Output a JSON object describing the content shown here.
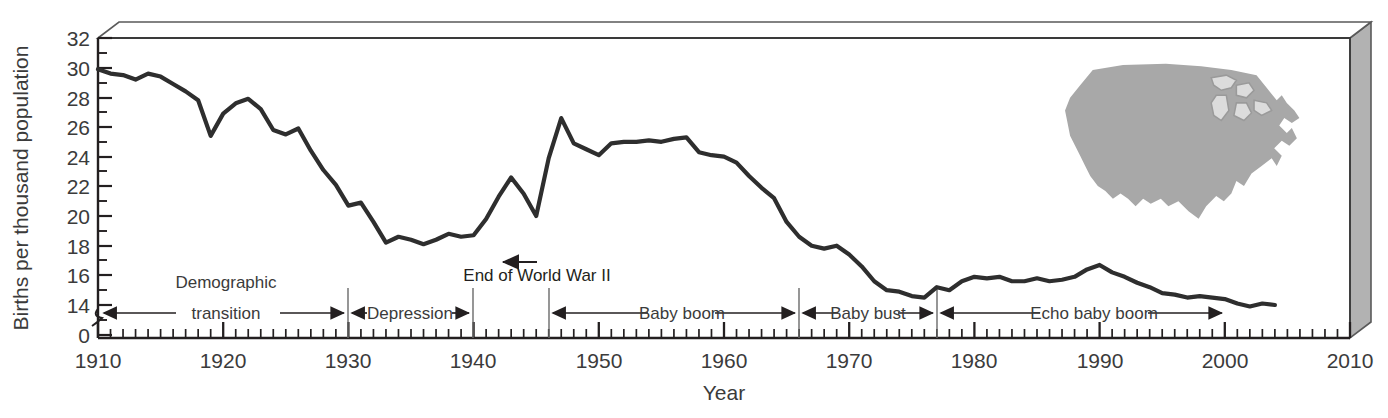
{
  "chart_data": {
    "type": "line",
    "title": "",
    "xlabel": "Year",
    "ylabel": "Births per thousand population",
    "xlim": [
      1910,
      2010
    ],
    "ylim": [
      0,
      32
    ],
    "y_axis_break": true,
    "y_break_label": "0",
    "grid": false,
    "legend": "none",
    "x_tick_labels": [
      "1910",
      "1920",
      "1930",
      "1940",
      "1950",
      "1960",
      "1970",
      "1980",
      "1990",
      "2000",
      "2010"
    ],
    "x_tick_step_minor": 1,
    "y_tick_labels": [
      "0",
      "14",
      "16",
      "18",
      "20",
      "22",
      "24",
      "26",
      "28",
      "30",
      "32"
    ],
    "x": [
      1910,
      1911,
      1912,
      1913,
      1914,
      1915,
      1916,
      1917,
      1918,
      1919,
      1920,
      1921,
      1922,
      1923,
      1924,
      1925,
      1926,
      1927,
      1928,
      1929,
      1930,
      1931,
      1932,
      1933,
      1934,
      1935,
      1936,
      1937,
      1938,
      1939,
      1940,
      1941,
      1942,
      1943,
      1944,
      1945,
      1946,
      1947,
      1948,
      1949,
      1950,
      1951,
      1952,
      1953,
      1954,
      1955,
      1956,
      1957,
      1958,
      1959,
      1960,
      1961,
      1962,
      1963,
      1964,
      1965,
      1966,
      1967,
      1968,
      1969,
      1970,
      1971,
      1972,
      1973,
      1974,
      1975,
      1976,
      1977,
      1978,
      1979,
      1980,
      1981,
      1982,
      1983,
      1984,
      1985,
      1986,
      1987,
      1988,
      1989,
      1990,
      1991,
      1992,
      1993,
      1994,
      1995,
      1996,
      1997,
      1998,
      1999,
      2000,
      2001,
      2002,
      2003,
      2004
    ],
    "values": [
      29.9,
      29.6,
      29.5,
      29.2,
      29.6,
      29.4,
      28.9,
      28.4,
      27.8,
      25.4,
      26.9,
      27.6,
      27.9,
      27.2,
      25.8,
      25.5,
      25.9,
      24.4,
      23.1,
      22.1,
      20.7,
      20.9,
      19.6,
      18.2,
      18.6,
      18.4,
      18.1,
      18.4,
      18.8,
      18.6,
      18.7,
      19.8,
      21.3,
      22.6,
      21.5,
      20.0,
      23.9,
      26.6,
      24.9,
      24.5,
      24.1,
      24.9,
      25.0,
      25.0,
      25.1,
      25.0,
      25.2,
      25.3,
      24.3,
      24.1,
      24.0,
      23.6,
      22.7,
      21.9,
      21.2,
      19.6,
      18.6,
      18.0,
      17.8,
      18.0,
      17.4,
      16.6,
      15.6,
      15.0,
      14.9,
      14.6,
      14.5,
      15.2,
      15.0,
      15.6,
      15.9,
      15.8,
      15.9,
      15.6,
      15.6,
      15.8,
      15.6,
      15.7,
      15.9,
      16.4,
      16.7,
      16.2,
      15.9,
      15.5,
      15.2,
      14.8,
      14.7,
      14.5,
      14.6,
      14.5,
      14.4,
      14.1,
      13.9,
      14.1,
      14.0
    ],
    "series_values_plot": [
      29.9,
      29.6,
      29.5,
      29.2,
      29.6,
      29.4,
      28.9,
      28.4,
      27.8,
      25.4,
      26.9,
      27.6,
      27.9,
      27.2,
      25.8,
      25.5,
      25.9,
      24.4,
      23.1,
      22.1,
      20.7,
      20.9,
      19.6,
      18.2,
      18.6,
      18.4,
      18.1,
      18.4,
      18.8,
      18.6,
      18.7,
      19.8,
      21.3,
      22.6,
      21.5,
      20.0,
      23.9,
      26.6,
      24.9,
      24.5,
      24.1,
      24.9,
      25.0,
      25.0,
      25.1,
      25.0,
      25.2,
      25.3,
      24.3,
      24.1,
      24.0,
      23.6,
      22.7,
      21.9,
      21.2,
      19.6,
      18.6,
      18.0,
      17.8,
      18.0,
      17.4,
      16.6,
      15.6,
      15.0,
      14.9,
      14.6,
      14.5,
      15.2,
      15.0,
      15.6,
      15.9,
      15.8,
      15.9,
      15.6,
      15.6,
      15.8,
      15.6,
      15.7,
      15.9,
      16.4,
      16.7,
      16.2,
      15.9,
      15.5,
      15.2,
      14.8,
      14.7,
      14.5,
      14.6,
      14.5,
      14.4,
      14.1,
      13.9,
      14.1,
      14.0
    ],
    "annotations": [
      {
        "name": "end-of-wwii",
        "text": "End of World War II",
        "x_year": 1945,
        "y_value": 20.0
      }
    ],
    "era_brackets": [
      {
        "name": "demographic-transition",
        "label": "Demographic transition",
        "start_year": 1910,
        "end_year": 1930,
        "arrows": "both"
      },
      {
        "name": "depression",
        "label": "Depression",
        "start_year": 1930,
        "end_year": 1940,
        "arrows": "both"
      },
      {
        "name": "baby-boom",
        "label": "Baby boom",
        "start_year": 1946,
        "end_year": 1964,
        "arrows": "both"
      },
      {
        "name": "baby-bust",
        "label": "Baby bust",
        "start_year": 1964,
        "end_year": 1977,
        "arrows": "both"
      },
      {
        "name": "echo-baby-boom",
        "label": "Echo baby boom",
        "start_year": 1977,
        "end_year": 2000,
        "arrows": "both"
      }
    ],
    "inset": {
      "name": "united-states-map",
      "description": "United States map silhouette",
      "fill": "#a8a8a8"
    },
    "colors": {
      "line": "#2e2e2e",
      "axis": "#231f20",
      "text": "#3b3b3b",
      "box_side": "#b2b2b2",
      "box_edge": "#555555",
      "map_fill": "#a8a8a8",
      "map_lakes": "#d8d8d8"
    }
  },
  "ylabel_text": "Births per thousand population",
  "xlabel_text": "Year",
  "era": {
    "demographic_line1": "Demographic",
    "demographic_line2": "transition",
    "depression": "Depression",
    "baby_boom": "Baby boom",
    "baby_bust": "Baby bust",
    "echo_baby_boom": "Echo baby boom"
  },
  "annotation_wwii": "End of World War II",
  "yticks": {
    "t0": "0",
    "t14": "14",
    "t16": "16",
    "t18": "18",
    "t20": "20",
    "t22": "22",
    "t24": "24",
    "t26": "26",
    "t28": "28",
    "t30": "30",
    "t32": "32"
  },
  "xticks": {
    "x1910": "1910",
    "x1920": "1920",
    "x1930": "1930",
    "x1940": "1940",
    "x1950": "1950",
    "x1960": "1960",
    "x1970": "1970",
    "x1980": "1980",
    "x1990": "1990",
    "x2000": "2000",
    "x2010": "2010"
  }
}
